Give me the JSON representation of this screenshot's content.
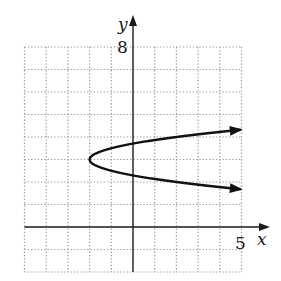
{
  "chart_data": {
    "type": "line",
    "title": "",
    "xlabel": "x",
    "ylabel": "y",
    "xlim": [
      -5,
      5
    ],
    "ylim": [
      -2,
      8
    ],
    "grid": true,
    "grid_style": "dotted",
    "grid_step": 1,
    "tick_labels": {
      "x": [
        "5"
      ],
      "y": [
        "8"
      ]
    },
    "series": [
      {
        "name": "parabola",
        "equation": "x = 4(y - 3)^2 - 2",
        "vertex": [
          -2,
          3
        ],
        "opens": "right",
        "arrows": "both ends",
        "points": [
          {
            "x": 5,
            "y": 4.32
          },
          {
            "x": 2,
            "y": 4.0
          },
          {
            "x": 0,
            "y": 3.71
          },
          {
            "x": -1,
            "y": 3.5
          },
          {
            "x": -2,
            "y": 3.0
          },
          {
            "x": -1,
            "y": 2.5
          },
          {
            "x": 0,
            "y": 2.29
          },
          {
            "x": 2,
            "y": 2.0
          },
          {
            "x": 5,
            "y": 1.68
          }
        ]
      }
    ]
  },
  "labels": {
    "x_axis": "x",
    "y_axis": "y",
    "x_max": "5",
    "y_max": "8"
  },
  "colors": {
    "axis": "#1a1a1a",
    "grid": "#9a9a9a",
    "curve": "#111111"
  }
}
